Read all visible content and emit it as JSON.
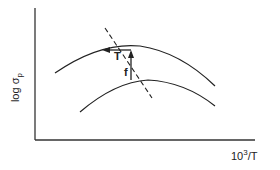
{
  "figure": {
    "y_axis_label": {
      "main": "log σ",
      "subscript": "p"
    },
    "x_axis_label": {
      "main": "10",
      "superscript": "3",
      "suffix": "/T"
    },
    "annotations": {
      "T_arrow_label": "T",
      "f_arrow_label": "f"
    },
    "curves": [
      {
        "name": "upper-curve",
        "description": "log σp vs 1000/T, higher curve"
      },
      {
        "name": "lower-curve",
        "description": "log σp vs 1000/T, lower curve"
      }
    ],
    "dashed_line": "locus of maxima",
    "colors": {
      "line": "#222222",
      "background": "#ffffff"
    }
  }
}
